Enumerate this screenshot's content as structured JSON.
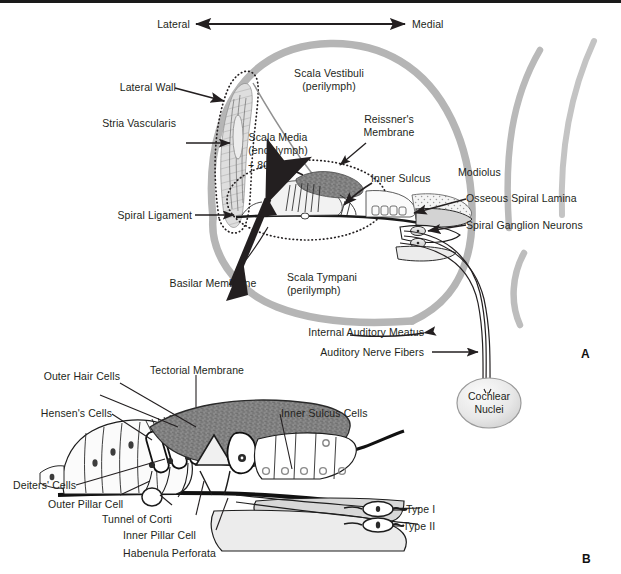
{
  "figure": {
    "background": "#ffffff",
    "top_rule_color": "#1a1a1a",
    "colors": {
      "ink": "#231f20",
      "bone_gray": "#b3b3b3",
      "fluid_gray": "#cfcfcf",
      "tectorial_gray": "#888888",
      "light_fill": "#e6e6e6",
      "stria_fill": "#d9d9d9"
    }
  },
  "orientation": {
    "left_label": "Lateral",
    "right_label": "Medial",
    "arrow": "double-headed-horizontal"
  },
  "panel_a": {
    "letter": "A",
    "labels": [
      {
        "id": "lateral-wall",
        "text": "Lateral Wall"
      },
      {
        "id": "stria-vascularis",
        "text": "Stria Vascularis"
      },
      {
        "id": "spiral-ligament",
        "text": "Spiral Ligament"
      },
      {
        "id": "scala-vestibuli",
        "text": "Scala Vestibuli\n(perilymph)"
      },
      {
        "id": "scala-media",
        "text": "Scala Media\n(endolymph)"
      },
      {
        "id": "endocochlear-potential",
        "text": "+ 80 mV"
      },
      {
        "id": "reissners-membrane",
        "text": "Reissner's\nMembrane"
      },
      {
        "id": "inner-sulcus",
        "text": "Inner Sulcus"
      },
      {
        "id": "modiolus",
        "text": "Modiolus"
      },
      {
        "id": "osseous-spiral-lamina",
        "text": "Osseous Spiral Lamina"
      },
      {
        "id": "spiral-ganglion-neurons",
        "text": "Spiral Ganglion Neurons"
      },
      {
        "id": "basilar-membrane",
        "text": "Basilar Membrane"
      },
      {
        "id": "scala-tympani",
        "text": "Scala Tympani\n(perilymph)"
      },
      {
        "id": "internal-auditory-meatus",
        "text": "Internal Auditory Meatus"
      },
      {
        "id": "auditory-nerve-fibers",
        "text": "Auditory Nerve Fibers"
      },
      {
        "id": "cochlear-nuclei",
        "text": "Cochlear\nNuclei"
      }
    ]
  },
  "panel_b": {
    "letter": "B",
    "labels": [
      {
        "id": "outer-hair-cells",
        "text": "Outer Hair Cells"
      },
      {
        "id": "tectorial-membrane",
        "text": "Tectorial Membrane"
      },
      {
        "id": "hensens-cells",
        "text": "Hensen's Cells"
      },
      {
        "id": "inner-sulcus-cells",
        "text": "Inner Sulcus Cells"
      },
      {
        "id": "deiters-cells",
        "text": "Deiters' Cells"
      },
      {
        "id": "outer-pillar-cell",
        "text": "Outer Pillar Cell"
      },
      {
        "id": "tunnel-of-corti",
        "text": "Tunnel of Corti"
      },
      {
        "id": "inner-pillar-cell",
        "text": "Inner Pillar Cell"
      },
      {
        "id": "habenula-perforata",
        "text": "Habenula Perforata"
      },
      {
        "id": "type-i",
        "text": "Type I"
      },
      {
        "id": "type-ii",
        "text": "Type II"
      }
    ]
  }
}
